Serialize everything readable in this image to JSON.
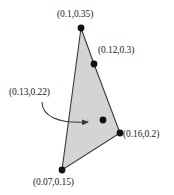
{
  "diagram": {
    "type": "polygon-coordinate-diagram",
    "colors": {
      "polygon_fill": "#d4d4d4",
      "polygon_stroke": "#3a3a3a",
      "point_fill": "#111111",
      "text": "#1a1a1a",
      "arrow": "#3a3a3a",
      "background": "#ffffff"
    },
    "polygon": {
      "vertices_px": [
        [
          81,
          28
        ],
        [
          94,
          64
        ],
        [
          120,
          133
        ],
        [
          62,
          170
        ]
      ]
    },
    "points": [
      {
        "id": "vertex-top",
        "label": "(0.1,0.35)",
        "x": 0.1,
        "y": 0.35,
        "px": [
          81,
          28
        ],
        "is_vertex": true
      },
      {
        "id": "vertex-upper-right",
        "label": "(0.12,0.3)",
        "x": 0.12,
        "y": 0.3,
        "px": [
          94,
          64
        ],
        "is_vertex": true
      },
      {
        "id": "vertex-right",
        "label": "(0.16,0.2)",
        "x": 0.16,
        "y": 0.2,
        "px": [
          120,
          133
        ],
        "is_vertex": true
      },
      {
        "id": "vertex-bottom",
        "label": "(0.07,0.15)",
        "x": 0.07,
        "y": 0.15,
        "px": [
          62,
          170
        ],
        "is_vertex": true
      },
      {
        "id": "interior-point",
        "label": "(0.13,0.22)",
        "x": 0.13,
        "y": 0.22,
        "px": [
          103,
          120
        ],
        "is_vertex": false
      }
    ],
    "annotation_arrow": {
      "from_px": [
        42,
        102
      ],
      "to_px": [
        91,
        122
      ],
      "points_to": "interior-point",
      "style": "curved-with-arrowhead"
    },
    "labels": {
      "top": "(0.1,0.35)",
      "upper_right": "(0.12,0.3)",
      "annotation": "(0.13,0.22)",
      "right": "(0.16,0.2)",
      "bottom": "(0.07,0.15)"
    }
  }
}
